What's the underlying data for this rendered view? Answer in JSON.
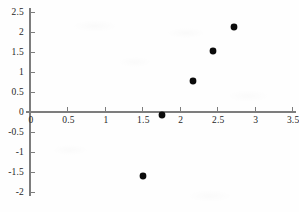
{
  "chart_data": {
    "type": "scatter",
    "title": "",
    "subtitle": "",
    "xlabel": "",
    "ylabel": "",
    "xlim": [
      0,
      3.5
    ],
    "ylim": [
      -2,
      2.5
    ],
    "grid": false,
    "legend": null,
    "xticks": [
      "0",
      "0.5",
      "1",
      "1.5",
      "2",
      "2.5",
      "3",
      "3.5"
    ],
    "xtick_values": [
      0,
      0.5,
      1,
      1.5,
      2,
      2.5,
      3,
      3.5
    ],
    "yticks": [
      "2.5",
      "2",
      "1.5",
      "1",
      "0.5",
      "0",
      "-0.5",
      "-1",
      "-1.5",
      "-2"
    ],
    "ytick_values": [
      2.5,
      2,
      1.5,
      1,
      0.5,
      0,
      -0.5,
      -1,
      -1.5,
      -2
    ],
    "marker": "filled-circle",
    "marker_color": "#0b0b0b",
    "axis_color": "#7d7d7d",
    "points": [
      {
        "x": 1.51,
        "y": -1.6
      },
      {
        "x": 1.76,
        "y": -0.08
      },
      {
        "x": 2.17,
        "y": 0.78
      },
      {
        "x": 2.44,
        "y": 1.53
      },
      {
        "x": 2.72,
        "y": 2.13
      }
    ],
    "x": [
      1.51,
      1.76,
      2.17,
      2.44,
      2.72
    ],
    "values": [
      -1.6,
      -0.08,
      0.78,
      1.53,
      2.13
    ]
  }
}
